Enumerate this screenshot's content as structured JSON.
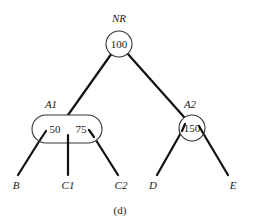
{
  "diagram": {
    "type": "tree",
    "caption": "(d)",
    "root": {
      "label": "NR",
      "keys": [
        "100"
      ]
    },
    "internal_nodes": [
      {
        "label": "A1",
        "keys": [
          "50",
          "75"
        ]
      },
      {
        "label": "A2",
        "keys": [
          "150"
        ]
      }
    ],
    "leaves": [
      {
        "label": "B"
      },
      {
        "label": "C1"
      },
      {
        "label": "C2"
      },
      {
        "label": "D"
      },
      {
        "label": "E"
      }
    ],
    "edges": [
      [
        "NR",
        "A1"
      ],
      [
        "NR",
        "A2"
      ],
      [
        "A1",
        "B"
      ],
      [
        "A1",
        "C1"
      ],
      [
        "A1",
        "C2"
      ],
      [
        "A2",
        "D"
      ],
      [
        "A2",
        "E"
      ]
    ]
  }
}
